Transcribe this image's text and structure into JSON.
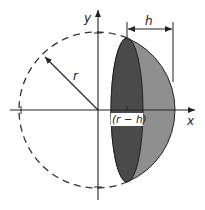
{
  "diagram": {
    "labels": {
      "y_axis": "y",
      "x_axis": "x",
      "radius": "r",
      "height": "h",
      "offset": "(r − h)"
    },
    "colors": {
      "cut_face": "#4a4a4a",
      "cap_surface": "#8f8f8f",
      "outline": "#222222",
      "dashed_circle": "#333333",
      "label_box": "#ffffff"
    }
  }
}
